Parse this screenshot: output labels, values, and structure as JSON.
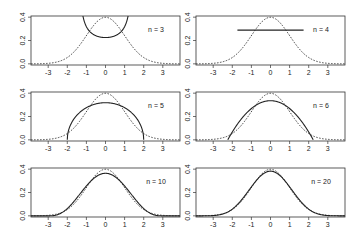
{
  "chart_data": [
    {
      "type": "line",
      "label": "n = 3",
      "n": 3,
      "xlim": [
        -3.9,
        3.9
      ],
      "ylim": [
        -0.01,
        0.41
      ],
      "xticks": [
        -3,
        -2,
        -1,
        0,
        1,
        2,
        3
      ],
      "yticks": [
        0.0,
        0.2,
        0.4
      ],
      "series": [
        {
          "name": "normal density",
          "style": "dashed",
          "formula": "N(0,1)"
        },
        {
          "name": "exact density",
          "style": "solid",
          "support": [
            -1.414,
            1.414
          ],
          "min_value": 0.225,
          "shape": "U (arcsine), clipped at 0.4 near x=±1.21"
        }
      ]
    },
    {
      "type": "line",
      "label": "n = 4",
      "n": 4,
      "xlim": [
        -3.9,
        3.9
      ],
      "ylim": [
        -0.01,
        0.41
      ],
      "xticks": [
        -3,
        -2,
        -1,
        0,
        1,
        2,
        3
      ],
      "yticks": [
        0.0,
        0.2,
        0.4
      ],
      "series": [
        {
          "name": "normal density",
          "style": "dashed",
          "formula": "N(0,1)"
        },
        {
          "name": "exact density",
          "style": "solid",
          "support": [
            -1.732,
            1.732
          ],
          "value": 0.289,
          "shape": "uniform"
        }
      ]
    },
    {
      "type": "line",
      "label": "n = 5",
      "n": 5,
      "xlim": [
        -3.9,
        3.9
      ],
      "ylim": [
        -0.01,
        0.41
      ],
      "xticks": [
        -3,
        -2,
        -1,
        0,
        1,
        2,
        3
      ],
      "yticks": [
        0.0,
        0.2,
        0.4
      ],
      "series": [
        {
          "name": "normal density",
          "style": "dashed",
          "formula": "N(0,1)"
        },
        {
          "name": "exact density",
          "style": "solid",
          "support": [
            -2,
            2
          ],
          "peak": 0.318,
          "shape": "semicircle"
        }
      ]
    },
    {
      "type": "line",
      "label": "n = 6",
      "n": 6,
      "xlim": [
        -3.9,
        3.9
      ],
      "ylim": [
        -0.01,
        0.41
      ],
      "xticks": [
        -3,
        -2,
        -1,
        0,
        1,
        2,
        3
      ],
      "yticks": [
        0.0,
        0.2,
        0.4
      ],
      "series": [
        {
          "name": "normal density",
          "style": "dashed",
          "formula": "N(0,1)"
        },
        {
          "name": "exact density",
          "style": "solid",
          "support": [
            -2.236,
            2.236
          ],
          "peak": 0.335,
          "shape": "parabola"
        }
      ]
    },
    {
      "type": "line",
      "label": "n = 10",
      "n": 10,
      "xlim": [
        -3.9,
        3.9
      ],
      "ylim": [
        -0.01,
        0.41
      ],
      "xticks": [
        -3,
        -2,
        -1,
        0,
        1,
        2,
        3
      ],
      "yticks": [
        0.0,
        0.2,
        0.4
      ],
      "series": [
        {
          "name": "normal density",
          "style": "dashed",
          "formula": "N(0,1)"
        },
        {
          "name": "exact density",
          "style": "solid",
          "support": [
            -3,
            3
          ],
          "peak": 0.365
        }
      ]
    },
    {
      "type": "line",
      "label": "n = 20",
      "n": 20,
      "xlim": [
        -3.9,
        3.9
      ],
      "ylim": [
        -0.01,
        0.41
      ],
      "xticks": [
        -3,
        -2,
        -1,
        0,
        1,
        2,
        3
      ],
      "yticks": [
        0.0,
        0.2,
        0.4
      ],
      "series": [
        {
          "name": "normal density",
          "style": "dashed",
          "formula": "N(0,1)"
        },
        {
          "name": "exact density",
          "style": "solid",
          "support": [
            -4.359,
            4.359
          ],
          "peak": 0.389
        }
      ]
    }
  ],
  "panels": [
    {
      "label": "n = 3"
    },
    {
      "label": "n = 4"
    },
    {
      "label": "n = 5"
    },
    {
      "label": "n = 6"
    },
    {
      "label": "n = 10"
    },
    {
      "label": "n = 20"
    }
  ],
  "axis": {
    "xtick_labels": [
      "-3",
      "-2",
      "-1",
      "0",
      "1",
      "2",
      "3"
    ],
    "ytick_labels": [
      "0.0",
      "0.2",
      "0.4"
    ]
  }
}
